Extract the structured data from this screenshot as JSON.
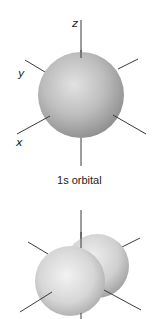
{
  "figures": [
    {
      "id": "s-orbital",
      "caption": {
        "orbital_number": "1",
        "orbital_letter": "s",
        "suffix": " orbital"
      },
      "axis_labels": {
        "z": "z",
        "y": "y",
        "x": "x"
      }
    },
    {
      "id": "p-orbital",
      "caption": null,
      "axis_labels": null
    }
  ],
  "colors": {
    "sphere_highlight": "#e6e6e6",
    "sphere_mid": "#bdbdbd",
    "sphere_shadow": "#8c8c8c",
    "lobe_highlight": "#f2f2f2",
    "lobe_mid": "#d2d2d2",
    "lobe_shadow": "#a8a8a8",
    "axis": "#3a3a3a"
  }
}
